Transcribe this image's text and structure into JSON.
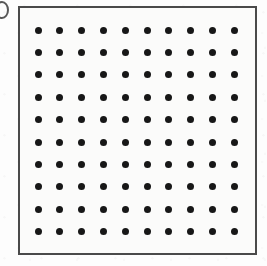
{
  "figure": {
    "background_color": "#fdfdfd",
    "plate_background_color": "#fbfbfa",
    "border_color": "#4a4a4a",
    "border_width_px": 2,
    "dot_color": "#171717",
    "dot_diameter_px": 7,
    "edge_glyph": {
      "name": "clipped-round-glyph",
      "color": "#3b3b3b"
    }
  },
  "chart_data": {
    "type": "scatter",
    "title": "",
    "subtitle": "",
    "xlabel": "",
    "ylabel": "",
    "legend": [],
    "annotations": [],
    "grid": false,
    "axis_ticks": [],
    "rows": 10,
    "columns": 10,
    "point_count": 100,
    "xlim": [
      1,
      10
    ],
    "ylim": [
      1,
      10
    ],
    "x_spacing": 21.8,
    "y_spacing": 22.4,
    "x_origin": 18,
    "y_origin": 22,
    "x": [
      1,
      2,
      3,
      4,
      5,
      6,
      7,
      8,
      9,
      10,
      1,
      2,
      3,
      4,
      5,
      6,
      7,
      8,
      9,
      10,
      1,
      2,
      3,
      4,
      5,
      6,
      7,
      8,
      9,
      10,
      1,
      2,
      3,
      4,
      5,
      6,
      7,
      8,
      9,
      10,
      1,
      2,
      3,
      4,
      5,
      6,
      7,
      8,
      9,
      10,
      1,
      2,
      3,
      4,
      5,
      6,
      7,
      8,
      9,
      10,
      1,
      2,
      3,
      4,
      5,
      6,
      7,
      8,
      9,
      10,
      1,
      2,
      3,
      4,
      5,
      6,
      7,
      8,
      9,
      10,
      1,
      2,
      3,
      4,
      5,
      6,
      7,
      8,
      9,
      10,
      1,
      2,
      3,
      4,
      5,
      6,
      7,
      8,
      9,
      10
    ],
    "y": [
      1,
      1,
      1,
      1,
      1,
      1,
      1,
      1,
      1,
      1,
      2,
      2,
      2,
      2,
      2,
      2,
      2,
      2,
      2,
      2,
      3,
      3,
      3,
      3,
      3,
      3,
      3,
      3,
      3,
      3,
      4,
      4,
      4,
      4,
      4,
      4,
      4,
      4,
      4,
      4,
      5,
      5,
      5,
      5,
      5,
      5,
      5,
      5,
      5,
      5,
      6,
      6,
      6,
      6,
      6,
      6,
      6,
      6,
      6,
      6,
      7,
      7,
      7,
      7,
      7,
      7,
      7,
      7,
      7,
      7,
      8,
      8,
      8,
      8,
      8,
      8,
      8,
      8,
      8,
      8,
      9,
      9,
      9,
      9,
      9,
      9,
      9,
      9,
      9,
      9,
      10,
      10,
      10,
      10,
      10,
      10,
      10,
      10,
      10,
      10
    ]
  }
}
